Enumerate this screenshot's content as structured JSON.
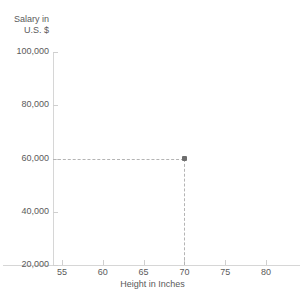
{
  "chart_data": {
    "type": "scatter",
    "title": "",
    "xlabel": "Height in Inches",
    "ylabel_lines": [
      "Salary in",
      "U.S. $"
    ],
    "ylabel": "Salary in U.S. $",
    "xlim": [
      55,
      80
    ],
    "ylim": [
      20000,
      100000
    ],
    "xticks": [
      55,
      60,
      65,
      70,
      75,
      80
    ],
    "xtick_labels": [
      "55",
      "60",
      "65",
      "70",
      "75",
      "80"
    ],
    "yticks": [
      20000,
      40000,
      60000,
      80000,
      100000
    ],
    "ytick_labels": [
      "20,000",
      "40,000",
      "60,000",
      "80,000",
      "100,000"
    ],
    "grid": false,
    "legend": "none",
    "points": [
      {
        "x": 70,
        "y": 60000,
        "label": ""
      }
    ],
    "guides": [
      {
        "orientation": "horizontal",
        "value": 60000,
        "style": "dashed",
        "from_axis": "y"
      },
      {
        "orientation": "vertical",
        "value": 70,
        "style": "dashed",
        "from_axis": "x"
      }
    ],
    "colors": {
      "marker": "#6e6e6e",
      "guide": "#b4b4b4",
      "axis": "#d6d6d6",
      "text": "#5a5a5a",
      "background": "#ffffff"
    }
  }
}
